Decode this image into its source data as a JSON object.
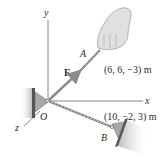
{
  "diagram": {
    "type": "3d-statics-force-diagram",
    "axes": {
      "x": "x",
      "y": "y",
      "z": "z"
    },
    "origin": {
      "label": "O"
    },
    "force": {
      "label": "F"
    },
    "points": [
      {
        "label": "A",
        "coordinates": "(6, 6, −3) m"
      },
      {
        "label": "B",
        "coordinates": "(10, −2, 3) m"
      }
    ],
    "colors": {
      "axis": "#6a6a6a",
      "force_arrow": "#8a8a8a",
      "wall": "#b8b8b8",
      "bracket": "#9a9a9a",
      "hand": "#d8d8d8",
      "text": "#2a2a2a"
    }
  }
}
